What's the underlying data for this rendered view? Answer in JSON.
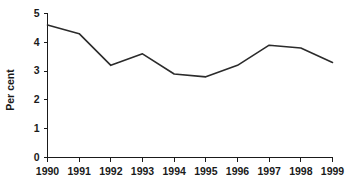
{
  "chart_data": {
    "type": "line",
    "title": "",
    "subtitle": "",
    "xlabel": "",
    "ylabel": "Per cent",
    "categories": [
      "1990",
      "1991",
      "1992",
      "1993",
      "1994",
      "1995",
      "1996",
      "1997",
      "1998",
      "1999"
    ],
    "x": [
      1990,
      1991,
      1992,
      1993,
      1994,
      1995,
      1996,
      1997,
      1998,
      1999
    ],
    "values": [
      4.6,
      4.3,
      3.2,
      3.6,
      2.9,
      2.8,
      3.2,
      3.9,
      3.8,
      3.3
    ],
    "series": [
      {
        "name": "Per cent",
        "values": [
          4.6,
          4.3,
          3.2,
          3.6,
          2.9,
          2.8,
          3.2,
          3.9,
          3.8,
          3.3
        ],
        "color": "#2b2b2b"
      }
    ],
    "ylim": [
      0,
      5
    ],
    "yticks": [
      0,
      1,
      2,
      3,
      4,
      5
    ],
    "ytick_labels": [
      "0",
      "1",
      "2",
      "3",
      "4",
      "5"
    ],
    "xtick_labels": [
      "1990",
      "1991",
      "1992",
      "1993",
      "1994",
      "1995",
      "1996",
      "1997",
      "1998",
      "1999"
    ],
    "grid": false,
    "legend": false,
    "legend_position": "none",
    "markers": false,
    "line_color": "#2b2b2b",
    "axis_color": "#1a1a1a",
    "background": "#ffffff"
  }
}
